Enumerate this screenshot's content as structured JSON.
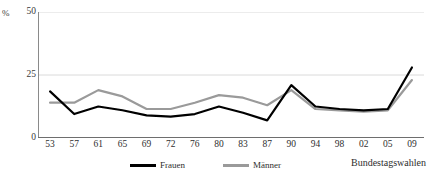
{
  "chart_data": {
    "type": "line",
    "title": "",
    "xlabel": "Bundestagswahlen",
    "ylabel": "%",
    "categories": [
      "53",
      "57",
      "61",
      "65",
      "69",
      "72",
      "76",
      "80",
      "83",
      "87",
      "90",
      "94",
      "98",
      "02",
      "05",
      "09"
    ],
    "ylim": [
      0,
      50
    ],
    "yticks": [
      0,
      25,
      50
    ],
    "ytick_labels": [
      "0",
      "25",
      "50"
    ],
    "grid": "horizontal",
    "legend_position": "bottom",
    "series": [
      {
        "name": "Frauen",
        "color": "#000000",
        "values": [
          18.5,
          9.5,
          12.5,
          11.0,
          9.0,
          8.5,
          9.5,
          12.5,
          10.0,
          7.0,
          21.0,
          12.5,
          11.5,
          11.0,
          11.5,
          28.0
        ]
      },
      {
        "name": "Männer",
        "color": "#9a9a9a",
        "values": [
          14.0,
          14.0,
          19.0,
          16.5,
          11.5,
          11.5,
          14.0,
          17.0,
          16.0,
          13.0,
          19.0,
          11.5,
          11.0,
          10.5,
          11.0,
          23.0
        ]
      }
    ]
  },
  "legend": {
    "items": [
      {
        "label": "Frauen",
        "color": "#000000"
      },
      {
        "label": "Männer",
        "color": "#9a9a9a"
      }
    ]
  },
  "axes": {
    "y_unit": "%",
    "x_title": "Bundestagswahlen"
  }
}
